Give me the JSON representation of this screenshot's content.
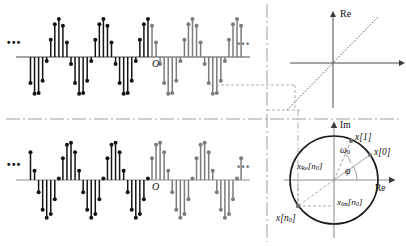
{
  "figure": {
    "colors": {
      "black": "#141414",
      "gray": "#7c7c7c",
      "axis": "#4a4a4a",
      "dash": "#8a8a8a",
      "light": "#b0b0b0"
    }
  },
  "top_plot": {
    "name": "real-part-stem-plot",
    "origin_label": "O",
    "ellipsis_left": "•••",
    "ellipsis_right": "•••",
    "axis_label": ""
  },
  "bottom_plot": {
    "name": "imaginary-part-stem-plot",
    "origin_label": "O",
    "ellipsis_left": "•••",
    "ellipsis_right": "•••"
  },
  "line_plot": {
    "name": "re-axis-diagonal-plot",
    "re_axis_label": "Re"
  },
  "phasor": {
    "name": "complex-plane-phasor-diagram",
    "im_axis_label": "Im",
    "re_axis_label": "Re",
    "omega_label": "ω",
    "omega_sub": "0",
    "phi_label": "φ",
    "x1_label": "x[1]",
    "x0_label": "x[0]",
    "x_re_label": "x",
    "x_re_sub": "Re",
    "x_re_index": "[n",
    "x_re_index_sub": "0",
    "x_re_close": "]",
    "x_im_label": "x",
    "x_im_sub": "Im",
    "x_im_index": "[n",
    "x_im_index_sub": "0",
    "x_im_close": "]",
    "xn0_label": "x",
    "xn0_index": "[n",
    "xn0_sub": "0",
    "xn0_close": "]"
  },
  "chart_data": {
    "type": "line",
    "panels": [
      {
        "id": "real-part",
        "type": "stem",
        "ylabel": "Re{x[n]}",
        "xlabel": "n",
        "description": "Cosine-like stem sequence, samples per period 11, amplitude 1",
        "samples_per_period": 11,
        "amplitude": 1.0,
        "phase_deg": 35,
        "n_start": -30,
        "n_end": 22,
        "black_until_n": 0,
        "gray_from_n": 0,
        "axis_y": 57
      },
      {
        "id": "imag-part",
        "type": "stem",
        "ylabel": "Im{x[n]}",
        "xlabel": "n",
        "description": "Sine-like stem sequence, samples per period 11, amplitude 1",
        "samples_per_period": 11,
        "amplitude": 1.0,
        "phase_deg": -55,
        "n_start": -30,
        "n_end": 22,
        "black_until_n": 0,
        "gray_from_n": 0,
        "axis_y": 180
      },
      {
        "id": "re-diagonal",
        "type": "line",
        "xlabel": "",
        "ylabel": "Re",
        "line": "45-degree diagonal through origin",
        "x": [
          -1,
          1
        ],
        "y": [
          -1,
          1
        ]
      },
      {
        "id": "phasor",
        "type": "scatter",
        "xlabel": "Re",
        "ylabel": "Im",
        "unit_circle_radius": 1.0,
        "points": [
          {
            "label": "x[0]",
            "angle_deg": 35,
            "radius": 1.0
          },
          {
            "label": "x[1]",
            "angle_deg": 68,
            "radius": 1.0
          },
          {
            "label": "x[n0]",
            "angle_deg": 215,
            "radius": 1.0
          }
        ],
        "angles": [
          {
            "label": "phi",
            "value_deg": 35
          },
          {
            "label": "omega_0",
            "value_deg": 33
          }
        ]
      }
    ]
  }
}
